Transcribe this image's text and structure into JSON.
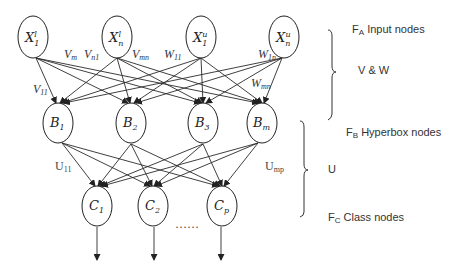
{
  "diagram": {
    "type": "fuzzy min-max neural network architecture",
    "layers": {
      "input": {
        "name": "F_A Input nodes",
        "nodes": [
          {
            "id": "x1l",
            "base": "X",
            "sup": "l",
            "sub": "1"
          },
          {
            "id": "xnl",
            "base": "X",
            "sup": "l",
            "sub": "n"
          },
          {
            "id": "x1u",
            "base": "X",
            "sup": "u",
            "sub": "1"
          },
          {
            "id": "xnu",
            "base": "X",
            "sup": "u",
            "sub": "n"
          }
        ]
      },
      "hyperbox": {
        "name": "F_B Hyperbox nodes",
        "nodes": [
          {
            "id": "b1",
            "base": "B",
            "sub": "1"
          },
          {
            "id": "b2",
            "base": "B",
            "sub": "2"
          },
          {
            "id": "b3",
            "base": "B",
            "sub": "3"
          },
          {
            "id": "bm",
            "base": "B",
            "sub": "m"
          }
        ]
      },
      "class": {
        "name": "F_C Class nodes",
        "nodes": [
          {
            "id": "c1",
            "base": "C",
            "sub": "1"
          },
          {
            "id": "c2",
            "base": "C",
            "sub": "2"
          },
          {
            "id": "cp",
            "base": "C",
            "sub": "p"
          }
        ],
        "ellipsis": "……"
      }
    },
    "weight_labels": {
      "v11": {
        "base": "V",
        "sub": "11"
      },
      "vm": {
        "base": "V",
        "sub": "m"
      },
      "vn1": {
        "base": "V",
        "sub": "n1"
      },
      "vmn": {
        "base": "V",
        "sub": "mn"
      },
      "w11": {
        "base": "W",
        "sub": "11"
      },
      "w1n": {
        "base": "W",
        "sub": "1n"
      },
      "wmn": {
        "base": "W",
        "sub": "mn"
      },
      "u11": {
        "base": "U",
        "sub": "11"
      },
      "ump": {
        "base": "U",
        "sub": "mp"
      }
    },
    "side_labels": {
      "fa_main": "F",
      "fa_sub": "A",
      "fa_text": " Input nodes",
      "vw": "V & W",
      "fb_main": "F",
      "fb_sub": "B",
      "fb_text": " Hyperbox nodes",
      "u": "U",
      "fc_main": "F",
      "fc_sub": "C",
      "fc_text": " Class nodes"
    }
  }
}
